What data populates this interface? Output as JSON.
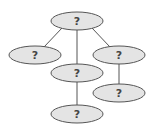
{
  "diagram": {
    "type": "tree",
    "colors": {
      "node_fill": "#e4e4e4",
      "node_stroke": "#555555",
      "edge": "#555555",
      "label": "#444444",
      "background": "#ffffff"
    },
    "nodes": [
      {
        "id": "root",
        "label": "?",
        "cx": 77,
        "cy": 21
      },
      {
        "id": "left",
        "label": "?",
        "cx": 35,
        "cy": 55
      },
      {
        "id": "middle",
        "label": "?",
        "cx": 77,
        "cy": 73
      },
      {
        "id": "right",
        "label": "?",
        "cx": 119,
        "cy": 55
      },
      {
        "id": "right-child",
        "label": "?",
        "cx": 119,
        "cy": 93
      },
      {
        "id": "bottom",
        "label": "?",
        "cx": 77,
        "cy": 114
      }
    ],
    "edges": [
      {
        "from": "root",
        "to": "left"
      },
      {
        "from": "root",
        "to": "middle"
      },
      {
        "from": "root",
        "to": "right"
      },
      {
        "from": "middle",
        "to": "bottom"
      },
      {
        "from": "right",
        "to": "right-child"
      }
    ]
  }
}
